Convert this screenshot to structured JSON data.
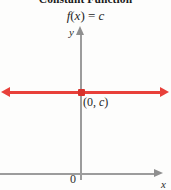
{
  "figure": {
    "title": "Constant Function",
    "formula": {
      "func": "f",
      "arg_open": "(",
      "variable": "x",
      "arg_close": ")",
      "equals": "=",
      "constant": "c"
    },
    "background_color": "#fdfdfc"
  },
  "axes": {
    "y_label": "y",
    "x_label": "x",
    "origin_label": "0",
    "axis_color": "#9c9c9c"
  },
  "graph": {
    "line_color": "#e8403a",
    "point_color": "#d8322c",
    "point_label": {
      "open": "(",
      "x_value": "0",
      "separator": ", ",
      "y_value": "c",
      "close": ")"
    }
  },
  "chart_data": {
    "type": "line",
    "title": "Constant Function",
    "annotations": [
      "f(x) = c",
      "(0, c)"
    ],
    "xlabel": "x",
    "ylabel": "y",
    "series": [
      {
        "name": "f(x) = c",
        "x": [
          -1000,
          1000
        ],
        "values": [
          "c",
          "c"
        ],
        "color": "#e8403a",
        "arrows": "both"
      }
    ],
    "points": [
      {
        "label": "(0, c)",
        "x": 0,
        "y": "c",
        "color": "#d8322c"
      }
    ],
    "grid": false,
    "legend": "none",
    "xlim": [
      "-∞",
      "∞"
    ],
    "ylim": [
      "-∞",
      "∞"
    ]
  }
}
